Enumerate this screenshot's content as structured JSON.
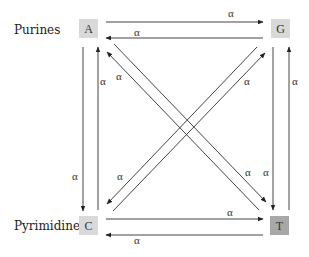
{
  "labels": {
    "purines": "Purines",
    "pyrimidines": "Pyrimidines"
  },
  "nodes": {
    "A": {
      "label": "A",
      "fill": "#d9d9d9"
    },
    "G": {
      "label": "G",
      "fill": "#d9d9d9"
    },
    "C": {
      "label": "C",
      "fill": "#d9d9d9"
    },
    "T": {
      "label": "T",
      "fill": "#a8a8a8"
    }
  },
  "rate_symbol": "α",
  "edges": [
    {
      "from": "A",
      "to": "G",
      "rate": "α"
    },
    {
      "from": "G",
      "to": "A",
      "rate": "α"
    },
    {
      "from": "A",
      "to": "C",
      "rate": "α"
    },
    {
      "from": "C",
      "to": "A",
      "rate": "α"
    },
    {
      "from": "G",
      "to": "T",
      "rate": "α"
    },
    {
      "from": "T",
      "to": "G",
      "rate": "α"
    },
    {
      "from": "C",
      "to": "T",
      "rate": "α"
    },
    {
      "from": "T",
      "to": "C",
      "rate": "α"
    },
    {
      "from": "A",
      "to": "T",
      "rate": "α"
    },
    {
      "from": "T",
      "to": "A",
      "rate": "α"
    },
    {
      "from": "G",
      "to": "C",
      "rate": "α"
    },
    {
      "from": "C",
      "to": "G",
      "rate": "α"
    }
  ],
  "alpha_labels": {
    "ag": "α",
    "ga": "α",
    "ac": "α",
    "ca": "α",
    "gt": "α",
    "tg": "α",
    "ct": "α",
    "tc": "α",
    "at": "α",
    "ta": "α",
    "gc": "α",
    "cg": "α"
  }
}
